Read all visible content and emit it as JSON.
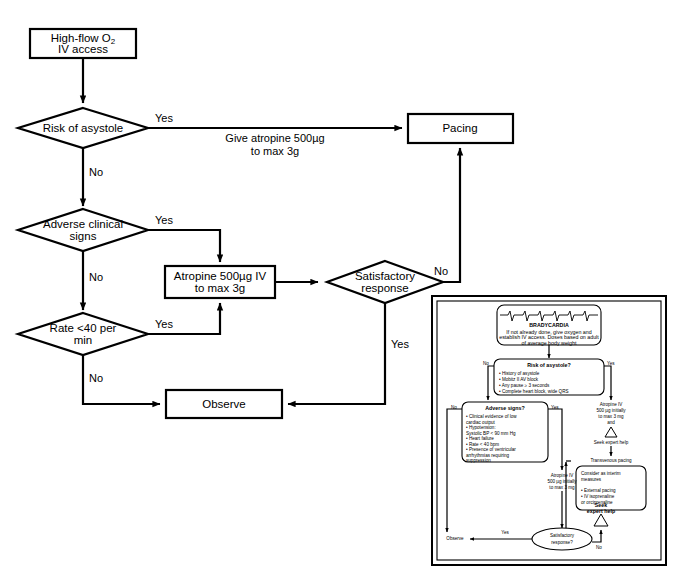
{
  "diagram": {
    "stroke_color": "#000000",
    "background_color": "#ffffff"
  },
  "main_flow": {
    "nodes": {
      "start": {
        "line1": "High-flow O",
        "sub1": "2",
        "line2": "IV access"
      },
      "risk_asystole": "Risk of asystole",
      "adverse_signs_l1": "Adverse clinical",
      "adverse_signs_l2": "signs",
      "rate40_l1": "Rate <40 per",
      "rate40_l2": "min",
      "atropine_l1": "Atropine 500µg IV",
      "atropine_l2": "to max 3g",
      "satisfactory_l1": "Satisfactory",
      "satisfactory_l2": "response",
      "pacing": "Pacing",
      "observe": "Observe"
    },
    "edge_labels": {
      "risk_yes": "Yes",
      "risk_no": "No",
      "give_atropine_l1": "Give atropine 500µg",
      "give_atropine_l2": "to max 3g",
      "adverse_yes": "Yes",
      "adverse_no": "No",
      "rate_yes": "Yes",
      "rate_no": "No",
      "satisfactory_no": "No",
      "satisfactory_yes": "Yes"
    }
  },
  "inset": {
    "brady": {
      "title": "BRADYCARDIA",
      "l1": "If not already done, give oxygen and",
      "l2": "establish IV access. Doses based on adult",
      "l3": "of average body weight"
    },
    "risk_asystole": {
      "title": "Risk of asystole?",
      "bullets": [
        "• History of asystole",
        "• Mobitz II AV block",
        "• Any pause ≥ 3 seconds",
        "• Complete heart block, wide QRS"
      ],
      "no": "No",
      "yes": "Yes"
    },
    "adverse": {
      "title": "Adverse signs?",
      "bullets": [
        "• Clinical evidence of low",
        "   cardiac output",
        "• Hypotension:",
        "   Systolic BP < 90 mm Hg",
        "• Heart failure",
        "• Rate < 40 bpm",
        "• Presence of ventricular",
        "   arrhythmias requiring",
        "   suppression"
      ],
      "no": "No",
      "yes": "Yes"
    },
    "atropine_right": {
      "l1": "Atropine IV",
      "l2": "500 µg initially",
      "l3": "to max 3 mg",
      "l4": "and"
    },
    "atropine_mid": {
      "l1": "Atropine IV",
      "l2": "500 µg initially",
      "l3": "to max 3 mg"
    },
    "seek_help_right": "Seek expert help",
    "seek_help_bottom_l1": "Seek",
    "seek_help_bottom_l2": "expert help",
    "transvenous_pacing": "Transvenous pacing",
    "interim": {
      "l1": "Consider as interim",
      "l2": "measures",
      "b1": "• External pacing",
      "b2": "• IV isoprenaline",
      "b3": "   or orciprenaline"
    },
    "satisfactory_l1": "Satisfactory",
    "satisfactory_l2": "response?",
    "observe": "Observe",
    "yes": "Yes",
    "no": "No"
  }
}
